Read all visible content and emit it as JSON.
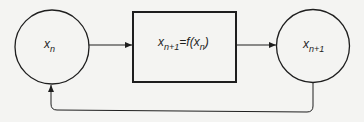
{
  "diagram": {
    "type": "iteration-feedback-loop",
    "nodes": [
      {
        "id": "input",
        "shape": "circle",
        "var": "x",
        "sub": "n"
      },
      {
        "id": "function",
        "shape": "rectangle",
        "lhs_var": "x",
        "lhs_sub": "n+1",
        "eq_sign": "=",
        "func": "f(",
        "arg_var": "x",
        "arg_sub": "n",
        "close": ")"
      },
      {
        "id": "output",
        "shape": "circle",
        "var": "x",
        "sub": "n+1"
      }
    ],
    "edges": [
      {
        "from": "input",
        "to": "function"
      },
      {
        "from": "function",
        "to": "output"
      },
      {
        "from": "output",
        "to": "input",
        "kind": "feedback"
      }
    ],
    "colors": {
      "stroke": "#1e1e1e",
      "background": "#f4f4f2"
    }
  }
}
